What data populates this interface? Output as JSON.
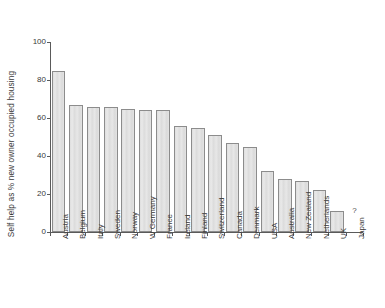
{
  "chart_data": {
    "type": "bar",
    "title": "",
    "xlabel": "",
    "ylabel": "Self help as % new owner occupied housing",
    "ylim": [
      0,
      100
    ],
    "yticks": [
      0,
      20,
      40,
      60,
      80,
      100
    ],
    "grid": false,
    "legend": null,
    "categories": [
      "Austria",
      "Belgium",
      "Italy",
      "Sweden",
      "Norway",
      "W Germany",
      "France",
      "Ireland",
      "Finland",
      "Switzerland",
      "Canada",
      "Denmark",
      "USA",
      "Australia",
      "New Zealand",
      "Netherlands",
      "UK",
      "Japan"
    ],
    "values": [
      85,
      67,
      66,
      66,
      65,
      64,
      64,
      56,
      55,
      51,
      47,
      45,
      32,
      28,
      27,
      22,
      11,
      null
    ],
    "annotations": [
      {
        "text": "?",
        "category": "Japan",
        "value": 9
      }
    ]
  }
}
